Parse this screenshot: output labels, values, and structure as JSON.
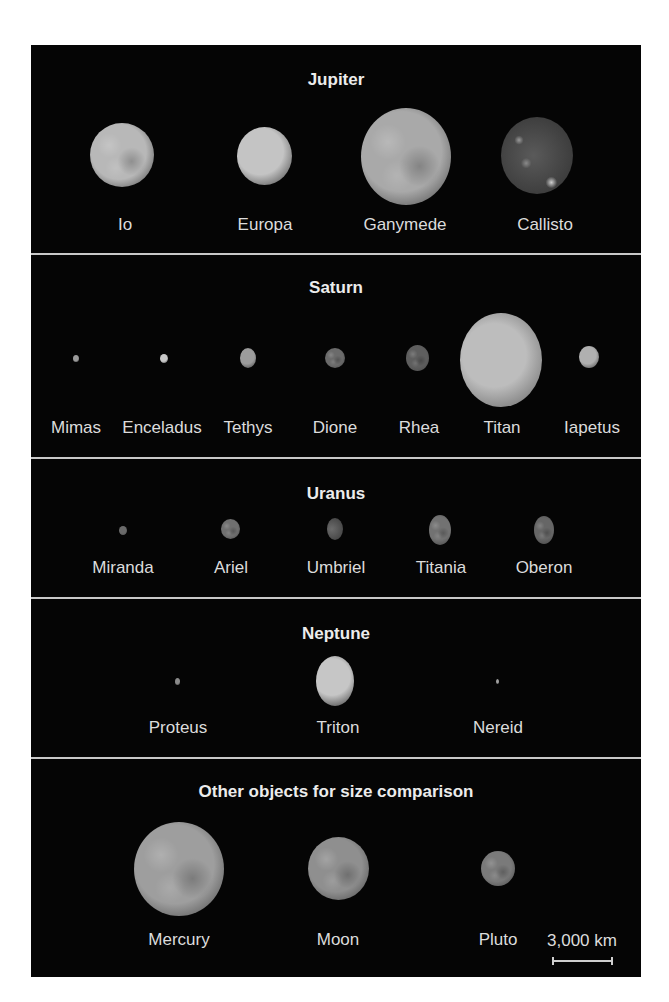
{
  "groups": [
    {
      "title": "Jupiter",
      "bodies": [
        {
          "name": "Io",
          "shade": "#b8b8b8",
          "tone": "mottled"
        },
        {
          "name": "Europa",
          "shade": "#c4c4c4",
          "tone": "smooth"
        },
        {
          "name": "Ganymede",
          "shade": "#a9a9a9",
          "tone": "mottled"
        },
        {
          "name": "Callisto",
          "shade": "#5a5a5a",
          "tone": "speckled"
        }
      ]
    },
    {
      "title": "Saturn",
      "bodies": [
        {
          "name": "Mimas",
          "shade": "#9a9a9a",
          "tone": "smooth"
        },
        {
          "name": "Enceladus",
          "shade": "#c8c8c8",
          "tone": "smooth"
        },
        {
          "name": "Tethys",
          "shade": "#9c9c9c",
          "tone": "smooth"
        },
        {
          "name": "Dione",
          "shade": "#6b6b6b",
          "tone": "mottled"
        },
        {
          "name": "Rhea",
          "shade": "#5e5e5e",
          "tone": "mottled"
        },
        {
          "name": "Titan",
          "shade": "#bdbdbd",
          "tone": "haze"
        },
        {
          "name": "Iapetus",
          "shade": "#b0b0b0",
          "tone": "smooth"
        }
      ]
    },
    {
      "title": "Uranus",
      "bodies": [
        {
          "name": "Miranda",
          "shade": "#6a6a6a",
          "tone": "smooth"
        },
        {
          "name": "Ariel",
          "shade": "#707070",
          "tone": "mottled"
        },
        {
          "name": "Umbriel",
          "shade": "#6c6c6c",
          "tone": "crescent"
        },
        {
          "name": "Titania",
          "shade": "#727272",
          "tone": "mottled"
        },
        {
          "name": "Oberon",
          "shade": "#666666",
          "tone": "mottled"
        }
      ]
    },
    {
      "title": "Neptune",
      "bodies": [
        {
          "name": "Proteus",
          "shade": "#8a8a8a",
          "tone": "smooth"
        },
        {
          "name": "Triton",
          "shade": "#c6c6c6",
          "tone": "smooth"
        },
        {
          "name": "Nereid",
          "shade": "#a0a0a0",
          "tone": "smooth"
        }
      ]
    },
    {
      "title": "Other objects for size comparison",
      "bodies": [
        {
          "name": "Mercury",
          "shade": "#9e9e9e",
          "tone": "mottled"
        },
        {
          "name": "Moon",
          "shade": "#8f8f8f",
          "tone": "mottled"
        },
        {
          "name": "Pluto",
          "shade": "#7a7a7a",
          "tone": "mottled"
        }
      ]
    }
  ],
  "scale_bar": {
    "label": "3,000 km",
    "length_km": 3000
  }
}
